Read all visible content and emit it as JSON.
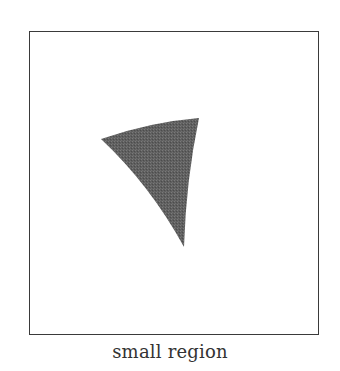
{
  "figure": {
    "caption": "small region",
    "frame": {
      "x": 29,
      "y": 31,
      "width": 290,
      "height": 304,
      "stroke": "#3a3a3a"
    },
    "region": {
      "shape": "curved-triangle",
      "fill": "#5f5f5f",
      "vertices": [
        [
          101,
          139
        ],
        [
          199,
          118
        ],
        [
          184,
          247
        ]
      ]
    }
  }
}
